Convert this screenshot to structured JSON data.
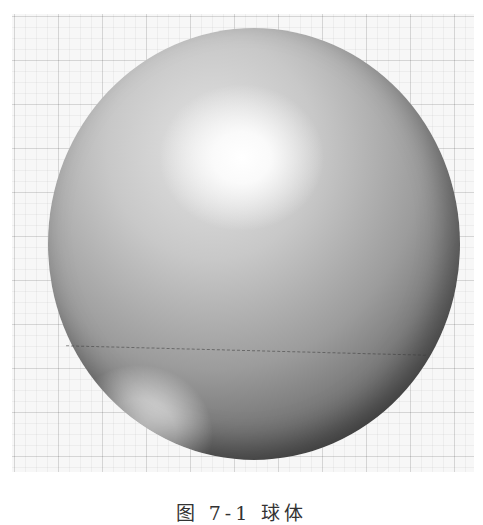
{
  "figure": {
    "background": "grid-paper",
    "caption": "图 7-1  球体"
  },
  "colors": {
    "background": "#ffffff",
    "grid": "#e0e0e0",
    "sphere_highlight": "#ffffff",
    "sphere_mid": "#b0b0b0",
    "sphere_shadow": "#3f3f3f"
  }
}
